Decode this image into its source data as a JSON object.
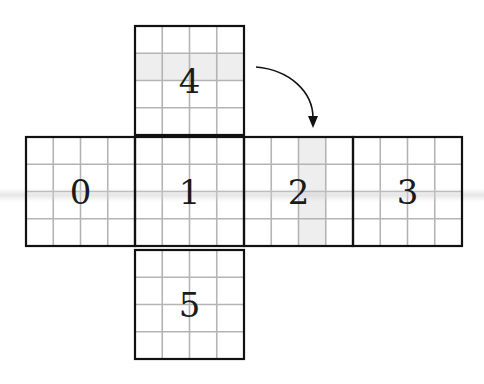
{
  "diagram": {
    "face_size": 109,
    "grid_divisions": 4,
    "faces": [
      {
        "id": 0,
        "label": "0",
        "x": 26,
        "y": 137
      },
      {
        "id": 1,
        "label": "1",
        "x": 135,
        "y": 137
      },
      {
        "id": 2,
        "label": "2",
        "x": 244,
        "y": 137
      },
      {
        "id": 3,
        "label": "3",
        "x": 353,
        "y": 137
      },
      {
        "id": 4,
        "label": "4",
        "x": 135,
        "y": 26
      },
      {
        "id": 5,
        "label": "5",
        "x": 135,
        "y": 250
      }
    ],
    "shaded_cells": [
      {
        "face": 4,
        "type": "row",
        "index": 1
      },
      {
        "face": 2,
        "type": "column",
        "index": 2
      }
    ],
    "arrow": {
      "from_face": 4,
      "to_face": 2,
      "description": "curved arrow indicating fold from face 4 toward face 2"
    },
    "colors": {
      "border": "#111111",
      "grid": "#b4b4b4",
      "shade": "#eeeeee",
      "label": "#1a1a1a"
    }
  }
}
